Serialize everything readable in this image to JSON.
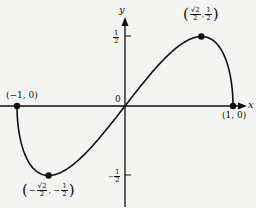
{
  "chart_data": {
    "type": "line",
    "title": "",
    "function": "y = x·sqrt(1 - x^2)",
    "xlabel": "x",
    "ylabel": "y",
    "xlim": [
      -1,
      1
    ],
    "ylim": [
      -0.5,
      0.5
    ],
    "grid": false,
    "legend": null,
    "origin_label": "0",
    "y_ticks": [
      {
        "value": 0.5,
        "label": "1/2"
      },
      {
        "value": -0.5,
        "label": "-1/2"
      }
    ],
    "x": [
      -1,
      -0.9,
      -0.7071,
      -0.5,
      -0.3,
      0,
      0.3,
      0.5,
      0.7071,
      0.9,
      1
    ],
    "values": [
      0,
      -0.392,
      -0.5,
      -0.433,
      -0.286,
      0,
      0.286,
      0.433,
      0.5,
      0.392,
      0
    ],
    "points": [
      {
        "x": -1,
        "y": 0,
        "label": "(−1, 0)"
      },
      {
        "x": -0.7071,
        "y": -0.5,
        "label": "(−√2/2, −1/2)"
      },
      {
        "x": 0.7071,
        "y": 0.5,
        "label": "(√2/2, 1/2)"
      },
      {
        "x": 1,
        "y": 0,
        "label": "(1, 0)"
      }
    ]
  },
  "labels": {
    "x_axis": "x",
    "y_axis": "y",
    "origin": "0",
    "pt_left": "(−1, 0)",
    "pt_right": "(1, 0)",
    "max_pre": "(",
    "max_num1": "√2",
    "max_den1": "2",
    "max_sep": ",",
    "max_num2": "1",
    "max_den2": "2",
    "max_post": ")",
    "min_pre": "(",
    "min_neg1": "−",
    "min_num1": "√2",
    "min_den1": "2",
    "min_sep": ", −",
    "min_num2": "1",
    "min_den2": "2",
    "min_post": ")",
    "ytick_pos_num": "1",
    "ytick_pos_den": "2",
    "ytick_neg_sign": "−",
    "ytick_neg_num": "1",
    "ytick_neg_den": "2"
  },
  "colors": {
    "ink": "#111111",
    "background": "#f4f4f2"
  }
}
